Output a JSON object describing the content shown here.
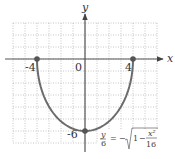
{
  "chart_data": {
    "type": "line",
    "title": "",
    "xlabel": "x",
    "ylabel": "y",
    "xlim": [
      -6,
      6
    ],
    "ylim": [
      -7,
      3
    ],
    "grid": true,
    "grid_style": "dotted",
    "x_tick_labels": [
      "-4",
      "0",
      "4"
    ],
    "y_tick_labels": [
      "-6"
    ],
    "series": [
      {
        "name": "y/6 = -sqrt(1 - x^2/16)",
        "description": "Lower half of ellipse x^2/16 + y^2/36 = 1",
        "x": [
          -4,
          -3.5,
          -3,
          -2,
          -1,
          0,
          1,
          2,
          3,
          3.5,
          4
        ],
        "y": [
          0,
          -2.9,
          -3.97,
          -5.2,
          -5.81,
          -6,
          -5.81,
          -5.2,
          -3.97,
          -2.9,
          0
        ]
      }
    ],
    "marked_points": [
      {
        "x": -4,
        "y": 0
      },
      {
        "x": 4,
        "y": 0
      },
      {
        "x": 0,
        "y": -6
      }
    ],
    "annotation": {
      "lhs_num": "y",
      "lhs_den": "6",
      "equals": "=",
      "minus": "−",
      "one": "1",
      "inner_minus": "−",
      "frac_num": "x²",
      "frac_den": "16"
    }
  },
  "colors": {
    "curve": "#6b6b6b",
    "axis": "#555555",
    "grid": "#b8b8b8",
    "point": "#555555"
  }
}
